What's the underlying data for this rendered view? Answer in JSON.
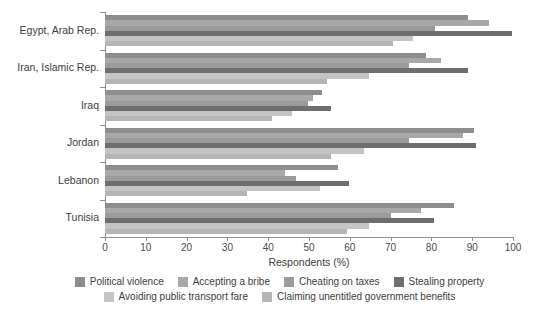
{
  "chart_data": {
    "type": "bar",
    "orientation": "horizontal",
    "title": "",
    "xlabel": "Respondents (%)",
    "ylabel": "",
    "xlim": [
      0,
      100
    ],
    "xticks": [
      0,
      10,
      20,
      30,
      40,
      50,
      60,
      70,
      80,
      90,
      100
    ],
    "grid": false,
    "legend_position": "bottom",
    "categories": [
      "Egypt, Arab Rep.",
      "Iran, Islamic Rep.",
      "Iraq",
      "Jordan",
      "Lebanon",
      "Tunisia"
    ],
    "series": [
      {
        "name": "Political violence",
        "color": "#8e8e8e",
        "values": [
          89,
          78.6,
          53.3,
          90.4,
          57,
          85.5
        ]
      },
      {
        "name": "Accepting a bribe",
        "color": "#a8a8a8",
        "values": [
          94,
          82.3,
          51.1,
          87.7,
          44.2,
          77.4
        ]
      },
      {
        "name": "Cheating on taxes",
        "color": "#9b9b9b",
        "values": [
          81,
          74.4,
          49.8,
          74.4,
          46.7,
          70
        ]
      },
      {
        "name": "Stealing property",
        "color": "#6e6e6e",
        "values": [
          99.7,
          89,
          55.3,
          90.9,
          59.7,
          80.7
        ]
      },
      {
        "name": "Avoiding public transport fare",
        "color": "#c4c4c4",
        "values": [
          75.4,
          64.6,
          45.9,
          63.5,
          52.6,
          64.6
        ]
      },
      {
        "name": "Claiming unentitled government benefits",
        "color": "#b5b5b5",
        "values": [
          70.5,
          54.5,
          41,
          55.3,
          34.9,
          59.4
        ]
      }
    ]
  },
  "axis": {
    "x_title": "Respondents (%)",
    "tick_labels": [
      "0",
      "10",
      "20",
      "30",
      "40",
      "50",
      "60",
      "70",
      "80",
      "90",
      "100"
    ]
  },
  "legend": {
    "row1": [
      {
        "label": "Political violence",
        "color": "#8e8e8e"
      },
      {
        "label": "Accepting a bribe",
        "color": "#a8a8a8"
      },
      {
        "label": "Cheating on taxes",
        "color": "#9b9b9b"
      },
      {
        "label": "Stealing property",
        "color": "#6e6e6e"
      }
    ],
    "row2": [
      {
        "label": "Avoiding public transport fare",
        "color": "#c4c4c4"
      },
      {
        "label": "Claiming unentitled government benefits",
        "color": "#b5b5b5"
      }
    ]
  }
}
